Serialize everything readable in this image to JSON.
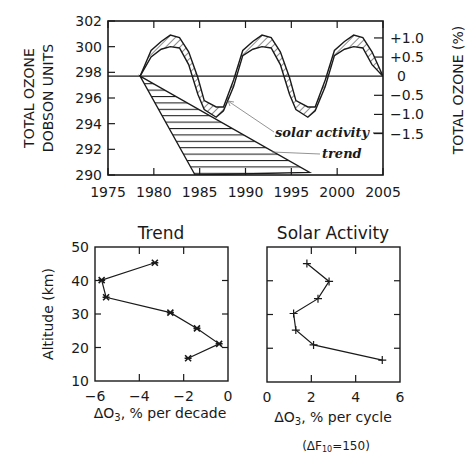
{
  "chart_data": [
    {
      "type": "line",
      "title": "",
      "xlabel": "",
      "ylabel": "TOTAL OZONE DOBSON UNITS",
      "ylabel_right": "TOTAL OZONE (%)",
      "xlim": [
        1975,
        2005
      ],
      "ylim": [
        290,
        302
      ],
      "x_ticks": [
        "1975",
        "1980",
        "1985",
        "1990",
        "1995",
        "2000",
        "2005"
      ],
      "y_ticks": [
        "290",
        "292",
        "294",
        "296",
        "298",
        "300",
        "302"
      ],
      "y_ticks_right": [
        "+1.0",
        "+0.5",
        "0",
        "-0.5",
        "-1.0",
        "-1.5"
      ],
      "baseline_du": 297.7,
      "annotations": [
        "solar activity",
        "trend"
      ],
      "series": [
        {
          "name": "solar activity (upper envelope)",
          "x": [
            1978.5,
            1979.7,
            1980.8,
            1981.8,
            1982.8,
            1983.8,
            1984.8,
            1985.5,
            1986.8,
            1987.6,
            1988.7,
            1989.7,
            1990.8,
            1991.8,
            1992.8,
            1993.8,
            1994.8,
            1995.5,
            1996.8,
            1997.6,
            1998.7,
            1999.7,
            2000.8,
            2001.8,
            2002.8,
            2003.8,
            2005
          ],
          "values": [
            297.7,
            299.7,
            300.4,
            300.9,
            300.7,
            299.6,
            297.6,
            295.8,
            295.3,
            295.3,
            297.4,
            299.7,
            300.4,
            300.9,
            300.7,
            299.6,
            297.6,
            295.8,
            295.3,
            295.3,
            297.4,
            299.7,
            300.4,
            300.9,
            300.7,
            299.6,
            297.7
          ]
        },
        {
          "name": "solar activity (lower envelope)",
          "x": [
            1978.5,
            1979.7,
            1980.8,
            1981.8,
            1982.8,
            1983.8,
            1984.8,
            1985.5,
            1986.8,
            1987.6,
            1988.7,
            1989.7,
            1990.8,
            1991.8,
            1992.8,
            1993.8,
            1994.8,
            1995.5,
            1996.8,
            1997.6,
            1998.7,
            1999.7,
            2000.8,
            2001.8,
            2002.8,
            2003.8,
            2005
          ],
          "values": [
            297.7,
            299.2,
            299.8,
            300.0,
            299.9,
            298.6,
            296.3,
            295.1,
            294.5,
            295.0,
            296.9,
            299.3,
            299.8,
            300.0,
            299.9,
            298.6,
            296.3,
            295.1,
            294.5,
            295.0,
            296.9,
            299.3,
            299.8,
            300.0,
            299.9,
            298.6,
            297.7
          ]
        },
        {
          "name": "trend (upper edge)",
          "x": [
            1978.5,
            1997
          ],
          "values": [
            297.7,
            290.2
          ]
        },
        {
          "name": "trend (lower edge)",
          "x": [
            1978.5,
            1984.5
          ],
          "values": [
            297.7,
            290.0
          ]
        }
      ]
    },
    {
      "type": "line",
      "title": "Trend",
      "xlabel": "ΔO3, % per decade",
      "ylabel": "Altitude (km)",
      "xlim": [
        -6,
        0
      ],
      "ylim": [
        10,
        50
      ],
      "x_ticks": [
        "-6",
        "-4",
        "-2",
        "0"
      ],
      "y_ticks": [
        "10",
        "20",
        "30",
        "40",
        "50"
      ],
      "series": [
        {
          "name": "Trend",
          "altitude": [
            45.3,
            40.1,
            35.0,
            30.4,
            25.7,
            21.1,
            16.8
          ],
          "values": [
            -3.3,
            -5.7,
            -5.5,
            -2.6,
            -1.4,
            -0.4,
            -1.8
          ]
        }
      ]
    },
    {
      "type": "line",
      "title": "Solar Activity",
      "xlabel": "ΔO3, % per cycle",
      "note": "(ΔF10=150)",
      "ylabel": "",
      "xlim": [
        0,
        6
      ],
      "ylim": [
        10,
        50
      ],
      "x_ticks": [
        "0",
        "2",
        "4",
        "6"
      ],
      "series": [
        {
          "name": "Solar Activity",
          "altitude": [
            45.1,
            39.8,
            34.7,
            30.3,
            25.4,
            21.0,
            16.5
          ],
          "values": [
            1.8,
            2.8,
            2.3,
            1.2,
            1.3,
            2.1,
            5.2
          ]
        }
      ]
    }
  ],
  "labels": {
    "top_ylabel_line1": "TOTAL OZONE",
    "top_ylabel_line2": "DOBSON UNITS",
    "top_ylabel_right": "TOTAL OZONE (%)",
    "annot_solar": "solar activity",
    "annot_trend": "trend",
    "trend_title": "Trend",
    "solar_title": "Solar Activity",
    "altitude_label": "Altitude (km)",
    "trend_xlabel_prefix": "ΔO",
    "trend_xlabel_sub": "3",
    "trend_xlabel_suffix": ", % per decade",
    "solar_xlabel_prefix": "ΔO",
    "solar_xlabel_sub": "3",
    "solar_xlabel_suffix": ", % per cycle",
    "note_prefix": "(ΔF",
    "note_sub": "10",
    "note_suffix": "=150)"
  },
  "colors": {
    "ink": "#1a1a1a",
    "background": "#ffffff",
    "pointer": "#777777"
  }
}
